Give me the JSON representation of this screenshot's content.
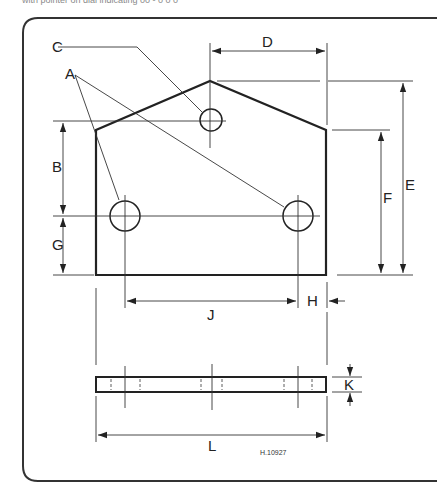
{
  "caption": "with pointer on dial indicating 00 - 0 0 0",
  "drawing": {
    "reference": "H.10927",
    "labels": {
      "A": "A",
      "B": "B",
      "C": "C",
      "D": "D",
      "E": "E",
      "F": "F",
      "G": "G",
      "H": "H",
      "J": "J",
      "K": "K",
      "L": "L"
    },
    "views": [
      "plan-view",
      "side-view"
    ]
  },
  "colors": {
    "line": "#222222",
    "frame": "#333333",
    "background": "#ffffff"
  }
}
